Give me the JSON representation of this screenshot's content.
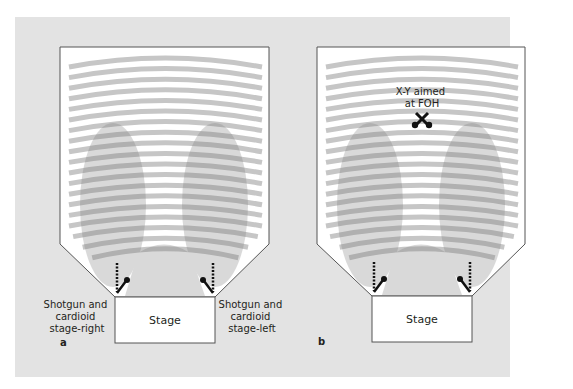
{
  "colors": {
    "page_bg": "#ffffff",
    "panel_bg": "#e3e3e3",
    "room_fill": "#ffffff",
    "room_outline": "#555555",
    "seat_row": "#c6c6c6",
    "pickup_pattern": "#9a9a9a",
    "mic": "#111111",
    "text": "#231f20"
  },
  "panels": [
    {
      "id": "a",
      "letter": "a",
      "stage_label": "Stage",
      "left_annotation": [
        "Shotgun and",
        "cardioid",
        "stage-right"
      ],
      "right_annotation": [
        "Shotgun and",
        "cardioid",
        "stage-left"
      ]
    },
    {
      "id": "b",
      "letter": "b",
      "stage_label": "Stage",
      "center_annotation": [
        "X-Y aimed",
        "at FOH"
      ]
    }
  ],
  "seating": {
    "row_count": 19
  }
}
